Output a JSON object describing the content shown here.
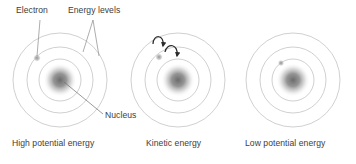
{
  "diagram": {
    "title_annotations": {
      "electron": "Electron",
      "energy_levels": "Energy levels",
      "nucleus": "Nucleus"
    },
    "colors": {
      "background": "#ffffff",
      "ring_stroke": "#b9b9b9",
      "nucleus_core": "#6e6e6e",
      "nucleus_mid": "#9a9a9a",
      "electron_dot": "#a9a9a9",
      "arrow": "#2b2b2b",
      "leader_line": "#7d7d7d",
      "text": "#3d3d3d"
    },
    "atoms": [
      {
        "id": "atom-high-potential",
        "caption": "High potential energy",
        "center": {
          "x": 60,
          "y": 80
        },
        "rings": [
          {
            "name": "ring-inner",
            "rx": 21,
            "ry": 21
          },
          {
            "name": "ring-middle",
            "rx": 33,
            "ry": 33
          },
          {
            "name": "ring-outer",
            "rx": 47,
            "ry": 47
          }
        ],
        "nucleus_radius": 14,
        "electron": {
          "x": 37,
          "y": 58,
          "r": 2.6,
          "shell": "outer"
        },
        "arrows": []
      },
      {
        "id": "atom-kinetic",
        "caption": "Kinetic energy",
        "center": {
          "x": 178,
          "y": 80
        },
        "rings": [
          {
            "name": "ring-inner",
            "rx": 21,
            "ry": 21
          },
          {
            "name": "ring-middle",
            "rx": 33,
            "ry": 33
          },
          {
            "name": "ring-outer",
            "rx": 47,
            "ry": 47
          }
        ],
        "nucleus_radius": 14,
        "electron": {
          "x": 159,
          "y": 57,
          "r": 2.6,
          "shell": "middle"
        },
        "arrows": [
          {
            "name": "transition-arrow-1"
          },
          {
            "name": "transition-arrow-2"
          }
        ]
      },
      {
        "id": "atom-low-potential",
        "caption": "Low potential energy",
        "center": {
          "x": 293,
          "y": 80
        },
        "rings": [
          {
            "name": "ring-inner",
            "rx": 21,
            "ry": 21
          },
          {
            "name": "ring-middle",
            "rx": 33,
            "ry": 33
          },
          {
            "name": "ring-outer",
            "rx": 47,
            "ry": 47
          }
        ],
        "nucleus_radius": 14,
        "electron": {
          "x": 281,
          "y": 63,
          "r": 2.6,
          "shell": "inner"
        },
        "arrows": []
      }
    ],
    "captions": [
      {
        "text": "High potential energy",
        "x": 12,
        "y": 140
      },
      {
        "text": "Kinetic energy",
        "x": 146,
        "y": 140
      },
      {
        "text": "Low potential energy",
        "x": 245,
        "y": 140
      }
    ],
    "labels": [
      {
        "text": "Electron",
        "x": 16,
        "y": 9
      },
      {
        "text": "Energy levels",
        "x": 68,
        "y": 9
      },
      {
        "text": "Nucleus",
        "x": 105,
        "y": 112
      }
    ]
  }
}
